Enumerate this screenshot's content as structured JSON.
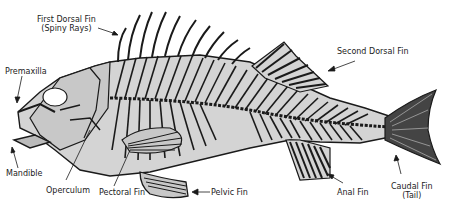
{
  "diagram": {
    "colors": {
      "body_fill": "#d4d4d4",
      "bone": "#1a1a1a",
      "background": "#ffffff",
      "label_text": "#222222"
    },
    "labels": [
      {
        "id": "first-dorsal",
        "line1": "First Dorsal Fin",
        "line2": "(Spiny Rays)"
      },
      {
        "id": "second-dorsal",
        "line1": "Second Dorsal Fin"
      },
      {
        "id": "premaxilla",
        "line1": "Premaxilla"
      },
      {
        "id": "mandible",
        "line1": "Mandible"
      },
      {
        "id": "operculum",
        "line1": "Operculum"
      },
      {
        "id": "pectoral",
        "line1": "Pectoral Fin"
      },
      {
        "id": "pelvic",
        "line1": "Pelvic Fin"
      },
      {
        "id": "anal",
        "line1": "Anal Fin"
      },
      {
        "id": "caudal",
        "line1": "Caudal Fin",
        "line2": "(Tail)"
      }
    ]
  }
}
